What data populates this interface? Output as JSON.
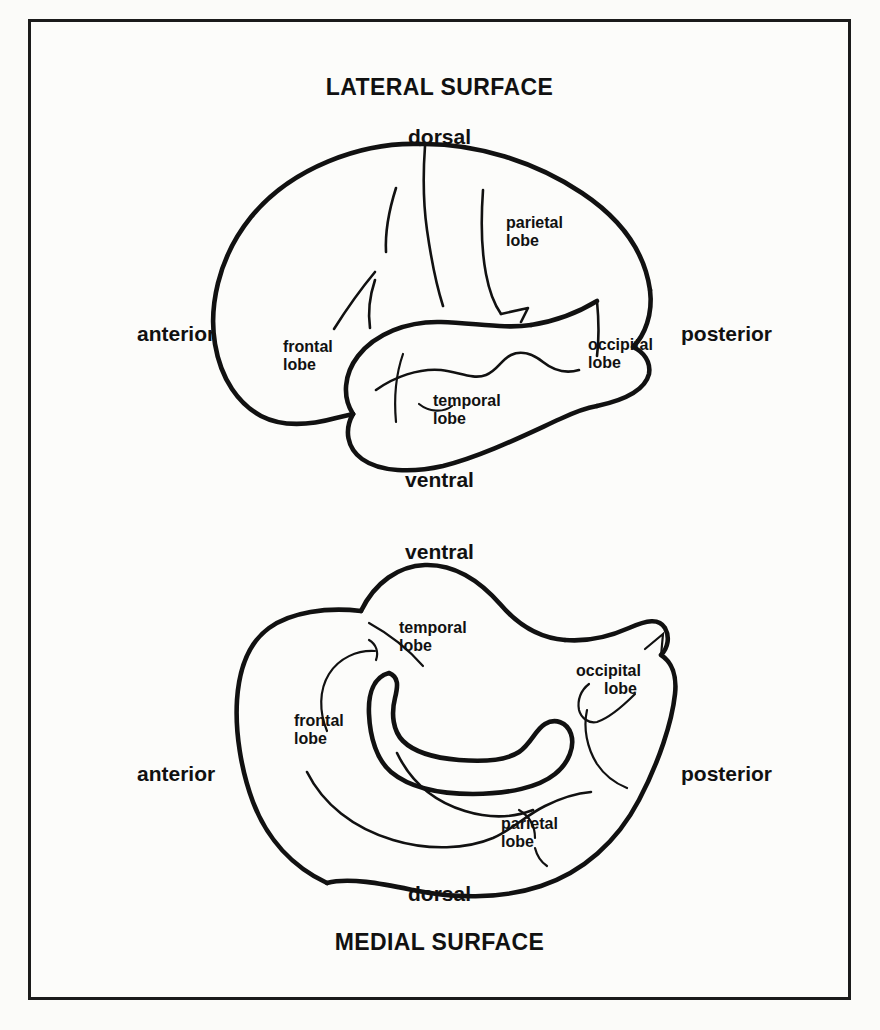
{
  "figure": {
    "lateral": {
      "title": "LATERAL SURFACE",
      "directions": {
        "dorsal": "dorsal",
        "ventral": "ventral",
        "anterior": "anterior",
        "posterior": "posterior"
      },
      "lobes": [
        {
          "id": "frontal",
          "line1": "frontal",
          "line2": "lobe"
        },
        {
          "id": "parietal",
          "line1": "parietal",
          "line2": "lobe"
        },
        {
          "id": "occipital",
          "line1": "occipital",
          "line2": "lobe"
        },
        {
          "id": "temporal",
          "line1": "temporal",
          "line2": "lobe"
        }
      ]
    },
    "medial": {
      "title": "MEDIAL SURFACE",
      "directions": {
        "dorsal": "dorsal",
        "ventral": "ventral",
        "anterior": "anterior",
        "posterior": "posterior"
      },
      "lobes": [
        {
          "id": "temporal",
          "line1": "temporal",
          "line2": "lobe"
        },
        {
          "id": "occipital",
          "line1": "occipital",
          "line2": "lobe"
        },
        {
          "id": "frontal",
          "line1": "frontal",
          "line2": "lobe"
        },
        {
          "id": "parietal",
          "line1": "parietal",
          "line2": "lobe"
        }
      ]
    },
    "style": {
      "ink": "#111111",
      "paper": "#fcfcfa",
      "border": "#1b1b1b"
    }
  }
}
